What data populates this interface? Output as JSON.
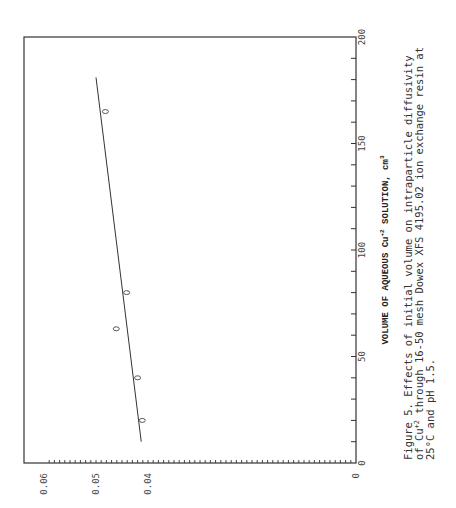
{
  "figure": {
    "caption_lines": [
      "Figure 5.  Effects of initial volume on intraparticle diffusivity",
      "of Cu  through 16-50 mesh Dowex XFS 4195.02 ion exchange resin at",
      "25°C and pH 1.5."
    ],
    "caption_superscript": "+2"
  },
  "chart_data": {
    "type": "scatter",
    "orientation": "rotated 90° clockwise (x-axis runs vertically along right edge, y-axis runs horizontally along bottom)",
    "xlabel": "VOLUME OF AQUEOUS Cu+2 SOLUTION, cm3",
    "ylabel": "",
    "xlim": [
      0,
      200
    ],
    "ylim": [
      0,
      0.06
    ],
    "x_ticks": [
      0,
      50,
      100,
      150,
      200
    ],
    "y_ticks": [
      0,
      0.04,
      0.05,
      0.06
    ],
    "x_tick_labels": [
      "0",
      "50",
      "100",
      "150",
      "200"
    ],
    "y_tick_labels": [
      "0",
      "0.04",
      "0.05",
      "0.06"
    ],
    "grid": false,
    "marker": "o",
    "series": [
      {
        "name": "measured",
        "x": [
          20,
          40,
          63,
          80,
          165
        ],
        "y": [
          0.0411,
          0.042,
          0.0461,
          0.0441,
          0.0482
        ]
      },
      {
        "name": "fit line",
        "type": "line",
        "x": [
          10,
          181
        ],
        "y": [
          0.0413,
          0.05
        ]
      }
    ]
  },
  "labels": {
    "x_axis_title_main": "VOLUME OF AQUEOUS Cu",
    "x_axis_title_sup": "+2",
    "x_axis_title_tail": " SOLUTION, cm",
    "x_axis_title_unit_sup": "3"
  }
}
